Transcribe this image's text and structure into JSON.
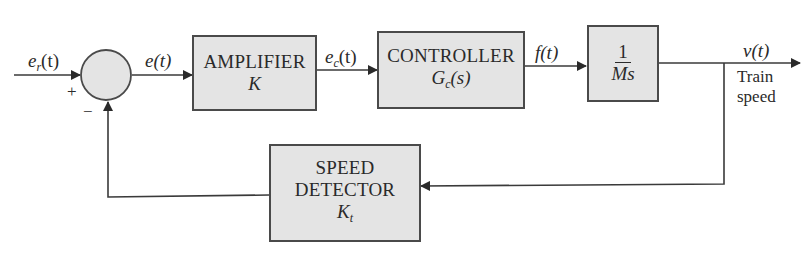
{
  "diagram": {
    "type": "block-diagram",
    "signals": {
      "reference": {
        "base": "e",
        "sub": "r",
        "tail": "(t)"
      },
      "error": {
        "text": "e(t)"
      },
      "control": {
        "base": "e",
        "sub": "c",
        "tail": "(t)"
      },
      "force": {
        "text": "f(t)"
      },
      "output": {
        "text": "v(t)",
        "caption_line1": "Train",
        "caption_line2": "speed"
      }
    },
    "summing_junction": {
      "plus_sign": "+",
      "minus_sign": "−"
    },
    "blocks": {
      "amplifier": {
        "title": "AMPLIFIER",
        "symbol": "K"
      },
      "controller": {
        "title": "CONTROLLER",
        "symbol_base": "G",
        "symbol_sub": "c",
        "symbol_tail": "(s)"
      },
      "plant": {
        "numerator": "1",
        "denominator": "Ms"
      },
      "speed_detector": {
        "title_line1": "SPEED",
        "title_line2": "DETECTOR",
        "symbol_base": "K",
        "symbol_sub": "t"
      }
    },
    "colors": {
      "block_fill": "#e4e4e4",
      "line": "#3a3a3a",
      "background": "#ffffff"
    }
  }
}
